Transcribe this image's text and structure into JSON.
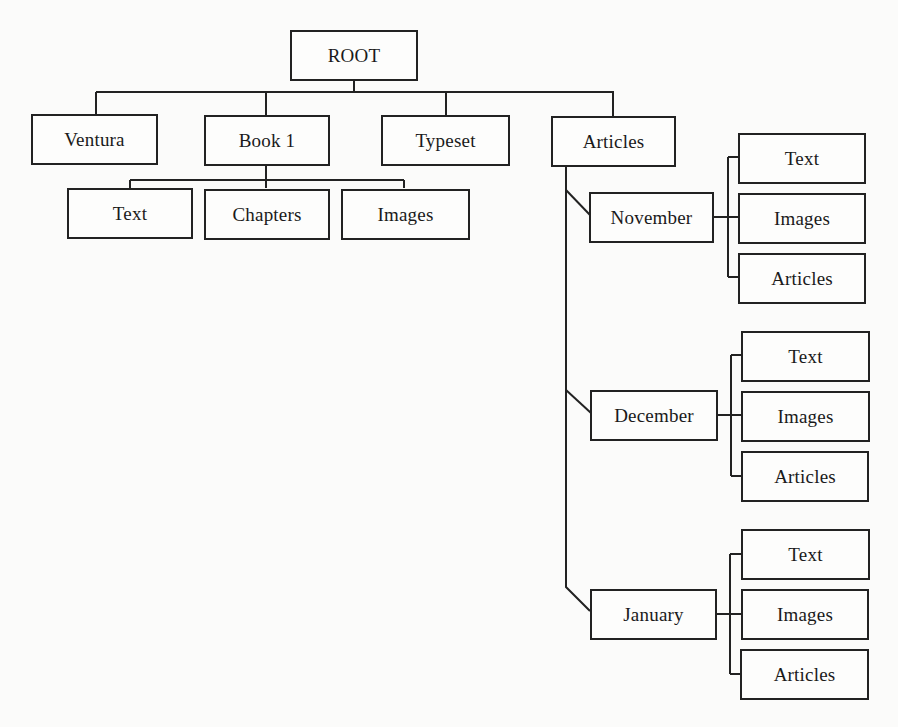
{
  "diagram": {
    "type": "directory-tree",
    "root": {
      "label": "ROOT",
      "children": [
        {
          "label": "Ventura"
        },
        {
          "label": "Book 1",
          "children": [
            {
              "label": "Text"
            },
            {
              "label": "Chapters"
            },
            {
              "label": "Images"
            }
          ]
        },
        {
          "label": "Typeset"
        },
        {
          "label": "Articles",
          "children": [
            {
              "label": "November",
              "children": [
                {
                  "label": "Text"
                },
                {
                  "label": "Images"
                },
                {
                  "label": "Articles"
                }
              ]
            },
            {
              "label": "December",
              "children": [
                {
                  "label": "Text"
                },
                {
                  "label": "Images"
                },
                {
                  "label": "Articles"
                }
              ]
            },
            {
              "label": "January",
              "children": [
                {
                  "label": "Text"
                },
                {
                  "label": "Images"
                },
                {
                  "label": "Articles"
                }
              ]
            }
          ]
        }
      ]
    }
  },
  "nodes": {
    "root": "ROOT",
    "ventura": "Ventura",
    "book1": "Book 1",
    "typeset": "Typeset",
    "articles": "Articles",
    "book1_text": "Text",
    "book1_chapters": "Chapters",
    "book1_images": "Images",
    "november": "November",
    "november_text": "Text",
    "november_images": "Images",
    "november_articles": "Articles",
    "december": "December",
    "december_text": "Text",
    "december_images": "Images",
    "december_articles": "Articles",
    "january": "January",
    "january_text": "Text",
    "january_images": "Images",
    "january_articles": "Articles"
  },
  "colors": {
    "line": "#222222",
    "background": "#fbfbfa"
  }
}
